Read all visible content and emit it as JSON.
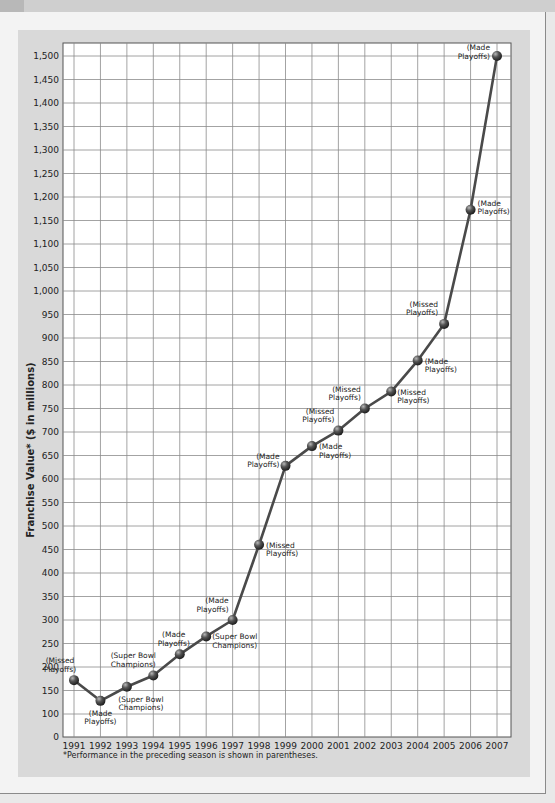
{
  "chart_data": {
    "type": "line",
    "title": "",
    "xlabel": "",
    "ylabel": "Franchise Value* ($ in millions)",
    "ylim": [
      0,
      1500
    ],
    "yticks": [
      0,
      100,
      150,
      200,
      250,
      300,
      350,
      400,
      450,
      500,
      550,
      600,
      650,
      700,
      750,
      800,
      850,
      900,
      950,
      1000,
      1050,
      1100,
      1150,
      1200,
      1250,
      1300,
      1350,
      1400,
      1450,
      1500
    ],
    "ytick_labels": [
      "0",
      "100",
      "150",
      "200",
      "250",
      "300",
      "350",
      "400",
      "450",
      "500",
      "550",
      "600",
      "650",
      "700",
      "750",
      "800",
      "850",
      "900",
      "950",
      "1,000",
      "1,050",
      "1,100",
      "1,150",
      "1,200",
      "1,250",
      "1,300",
      "1,350",
      "1,400",
      "1,450",
      "1,500"
    ],
    "grid": true,
    "legend": null,
    "x": [
      "1991",
      "1992",
      "1993",
      "1994",
      "1995",
      "1996",
      "1997",
      "1998",
      "1999",
      "2000",
      "2001",
      "2002",
      "2003",
      "2004",
      "2005",
      "2006",
      "2007"
    ],
    "series": [
      {
        "name": "Franchise Value",
        "values": [
          172,
          128,
          158,
          182,
          227,
          265,
          300,
          460,
          628,
          670,
          703,
          750,
          786,
          852,
          930,
          1173,
          1500
        ]
      }
    ],
    "annotations": [
      {
        "x": "1991",
        "text": [
          "(Missed",
          "Playoffs)"
        ]
      },
      {
        "x": "1992",
        "text": [
          "(Made",
          "Playoffs)"
        ]
      },
      {
        "x": "1993",
        "text": [
          "(Super Bowl",
          "Champions)"
        ]
      },
      {
        "x": "1994",
        "text": [
          "(Super Bowl",
          "Champions)"
        ]
      },
      {
        "x": "1995",
        "text": [
          "(Made",
          "Playoffs)"
        ]
      },
      {
        "x": "1996",
        "text": [
          "(Super Bowl",
          "Champions)"
        ]
      },
      {
        "x": "1997",
        "text": [
          "(Made",
          "Playoffs)"
        ]
      },
      {
        "x": "1998",
        "text": [
          "(Missed",
          "Playoffs)"
        ]
      },
      {
        "x": "1999",
        "text": [
          "(Made",
          "Playoffs)"
        ]
      },
      {
        "x": "2000",
        "text": [
          "(Made",
          "Playoffs)"
        ]
      },
      {
        "x": "2001",
        "text": [
          "(Missed",
          "Playoffs)"
        ]
      },
      {
        "x": "2002",
        "text": [
          "(Missed",
          "Playoffs)"
        ]
      },
      {
        "x": "2003",
        "text": [
          "(Missed",
          "Playoffs)"
        ]
      },
      {
        "x": "2004",
        "text": [
          "(Made",
          "Playoffs)"
        ]
      },
      {
        "x": "2005",
        "text": [
          "(Missed",
          "Playoffs)"
        ]
      },
      {
        "x": "2006",
        "text": [
          "(Made",
          "Playoffs)"
        ]
      },
      {
        "x": "2007",
        "text": [
          "(Made",
          "Playoffs)"
        ]
      }
    ],
    "footnote": "*Performance in the preceding season is shown in parentheses.",
    "colors": {
      "line": "#4a4a4a",
      "marker": "#3a3a3a",
      "grid": "#8c8c8c",
      "panel": "#d9d9d9",
      "plot_bg": "#ffffff"
    }
  },
  "labels": {
    "ylabel": "Franchise Value* ($ in millions)",
    "footnote": "*Performance in the preceding season is shown in parentheses."
  },
  "annotation_layout": [
    {
      "dx": -14,
      "dy": -17,
      "anchor": "middle"
    },
    {
      "dx": 0,
      "dy": 15,
      "anchor": "middle"
    },
    {
      "dx": 14,
      "dy": 15,
      "anchor": "middle"
    },
    {
      "dx": -20,
      "dy": -17,
      "anchor": "middle"
    },
    {
      "dx": -6,
      "dy": -17,
      "anchor": "middle"
    },
    {
      "dx": 6,
      "dy": 3,
      "anchor": "start"
    },
    {
      "dx": -4,
      "dy": -17,
      "anchor": "end"
    },
    {
      "dx": 7,
      "dy": 3,
      "anchor": "start"
    },
    {
      "dx": -6,
      "dy": -7,
      "anchor": "end"
    },
    {
      "dx": 7,
      "dy": 3,
      "anchor": "start"
    },
    {
      "dx": -4,
      "dy": -17,
      "anchor": "end"
    },
    {
      "dx": -4,
      "dy": -17,
      "anchor": "end"
    },
    {
      "dx": 6,
      "dy": 3,
      "anchor": "start"
    },
    {
      "dx": 7,
      "dy": 3,
      "anchor": "start"
    },
    {
      "dx": -6,
      "dy": -17,
      "anchor": "end"
    },
    {
      "dx": 7,
      "dy": -4,
      "anchor": "start"
    },
    {
      "dx": -7,
      "dy": -6,
      "anchor": "end"
    }
  ]
}
